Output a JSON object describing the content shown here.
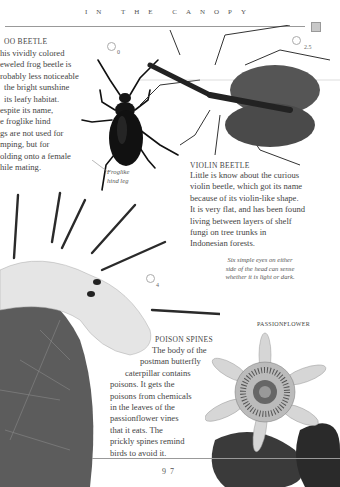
{
  "header": {
    "title": "IN THE CANOPY"
  },
  "frog_beetle": {
    "heading": "OO BEETLE",
    "lines": [
      "his vividly colored",
      "eweled frog beetle is",
      "robably less noticeable",
      "the bright sunshine",
      "its leafy habitat.",
      "espite its name,",
      "e froglike hind",
      "gs are not used for",
      "mping, but for",
      "olding onto a female",
      "hile mating."
    ],
    "caption": [
      "Froglike",
      "hind leg"
    ],
    "scale": "0"
  },
  "violin_beetle": {
    "heading": "VIOLIN BEETLE",
    "lines": [
      "Little is know about the curious",
      "violin beetle, which got its name",
      "because of its violin-like shape.",
      "It is very flat, and has been found",
      "living between layers of shelf",
      "fungi on tree trunks in",
      "Indonesian forests."
    ],
    "scale": "2.5",
    "caption": [
      "Six simple eyes on either",
      "side of the head can sense",
      "whether it is light or dark."
    ]
  },
  "poison_spines": {
    "heading": "POISON SPINES",
    "lines": [
      "The body of the",
      "postman butterfly",
      "caterpillar contains",
      "poisons. It gets the",
      "poisons from chemicals",
      "in the leaves of the",
      "passionflower vines",
      "that it eats. The",
      "prickly spines remind",
      "birds to avoid it."
    ],
    "scale": "4"
  },
  "passionflower": {
    "label": "PASSIONFLOWER"
  },
  "footer": {
    "page_number": "97"
  },
  "colors": {
    "text": "#444444",
    "rule": "#999999",
    "box": "#c8c8c8"
  }
}
